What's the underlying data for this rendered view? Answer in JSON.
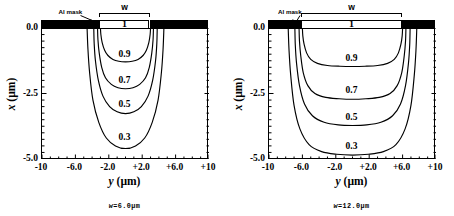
{
  "figure": {
    "panels": [
      {
        "id": "left",
        "caption": "w=6.0µm",
        "mask_label": "Al mask",
        "width_label": "w",
        "surface_label": "1",
        "opening_um": 6.0,
        "x_axis": {
          "title_var": "y",
          "title_unit": "(µm)",
          "ticks": [
            "-10",
            "-6.0",
            "-2.0",
            "+2.0",
            "+6.0",
            "+10"
          ],
          "values": [
            -10,
            -6,
            -2,
            2,
            6,
            10
          ],
          "range": [
            -10,
            10
          ]
        },
        "y_axis": {
          "title_var": "x",
          "title_unit": "(µm)",
          "ticks": [
            "0.0",
            "-2.5",
            "-5.0"
          ],
          "values": [
            0,
            -2.5,
            -5
          ],
          "range": [
            -5,
            0
          ]
        },
        "contour_labels": [
          "0.9",
          "0.7",
          "0.5",
          "0.3"
        ]
      },
      {
        "id": "right",
        "caption": "w=12.0µm",
        "mask_label": "Al mask",
        "width_label": "w",
        "surface_label": "1",
        "opening_um": 12.0,
        "x_axis": {
          "title_var": "y",
          "title_unit": "(µm)",
          "ticks": [
            "-10",
            "-6.0",
            "-2.0",
            "+2.0",
            "+6.0",
            "+10"
          ],
          "values": [
            -10,
            -6,
            -2,
            2,
            6,
            10
          ],
          "range": [
            -10,
            10
          ]
        },
        "y_axis": {
          "title_var": "x",
          "title_unit": "(µm)",
          "ticks": [
            "0.0",
            "-2.5",
            "-5.0"
          ],
          "values": [
            0,
            -2.5,
            -5
          ],
          "range": [
            -5,
            0
          ]
        },
        "contour_labels": [
          "0.9",
          "0.7",
          "0.5",
          "0.3"
        ]
      }
    ]
  },
  "chart_data": [
    {
      "type": "line",
      "title": "w=6.0µm",
      "xlabel": "y (µm)",
      "ylabel": "x (µm)",
      "xlim": [
        -10,
        10
      ],
      "ylim": [
        -5,
        0
      ],
      "grid": false,
      "legend": "inline-contour-labels",
      "annotations": [
        "Al mask",
        "w",
        "1"
      ],
      "mask_opening_um": 6.0,
      "mask_edges_um": [
        -3.0,
        3.0
      ],
      "series": [
        {
          "name": "0.9",
          "level": 0.9,
          "x": [
            -3.0,
            -2.95,
            -2.8,
            -2.5,
            -2.1,
            -1.5,
            -0.8,
            0.0,
            0.8,
            1.5,
            2.1,
            2.5,
            2.8,
            2.95,
            3.0
          ],
          "y": [
            0.0,
            -0.25,
            -0.55,
            -0.85,
            -1.05,
            -1.2,
            -1.27,
            -1.29,
            -1.27,
            -1.2,
            -1.05,
            -0.85,
            -0.55,
            -0.25,
            0.0
          ]
        },
        {
          "name": "0.7",
          "level": 0.7,
          "x": [
            -3.35,
            -3.3,
            -3.15,
            -2.85,
            -2.4,
            -1.7,
            -0.9,
            0.0,
            0.9,
            1.7,
            2.4,
            2.85,
            3.15,
            3.3,
            3.35
          ],
          "y": [
            0.0,
            -0.45,
            -0.95,
            -1.5,
            -1.9,
            -2.15,
            -2.28,
            -2.32,
            -2.28,
            -2.15,
            -1.9,
            -1.5,
            -0.95,
            -0.45,
            0.0
          ]
        },
        {
          "name": "0.5",
          "level": 0.5,
          "x": [
            -3.8,
            -3.75,
            -3.6,
            -3.25,
            -2.7,
            -1.9,
            -1.0,
            0.0,
            1.0,
            1.9,
            2.7,
            3.25,
            3.6,
            3.75,
            3.8
          ],
          "y": [
            0.0,
            -0.6,
            -1.25,
            -2.0,
            -2.6,
            -3.0,
            -3.2,
            -3.27,
            -3.2,
            -3.0,
            -2.6,
            -2.0,
            -1.25,
            -0.6,
            0.0
          ]
        },
        {
          "name": "0.3",
          "level": 0.3,
          "x": [
            -4.6,
            -4.5,
            -4.3,
            -3.9,
            -3.2,
            -2.3,
            -1.2,
            0.0,
            1.2,
            2.3,
            3.2,
            3.9,
            4.3,
            4.5,
            4.6
          ],
          "y": [
            0.0,
            -0.8,
            -1.7,
            -2.75,
            -3.6,
            -4.2,
            -4.5,
            -4.6,
            -4.5,
            -4.2,
            -3.6,
            -2.75,
            -1.7,
            -0.8,
            0.0
          ]
        }
      ]
    },
    {
      "type": "line",
      "title": "w=12.0µm",
      "xlabel": "y (µm)",
      "ylabel": "x (µm)",
      "xlim": [
        -10,
        10
      ],
      "ylim": [
        -5,
        0
      ],
      "grid": false,
      "legend": "inline-contour-labels",
      "annotations": [
        "Al mask",
        "w",
        "1"
      ],
      "mask_opening_um": 12.0,
      "mask_edges_um": [
        -6.0,
        6.0
      ],
      "series": [
        {
          "name": "0.9",
          "level": 0.9,
          "x": [
            -6.0,
            -5.95,
            -5.8,
            -5.5,
            -5.0,
            -4.2,
            -3.0,
            -1.5,
            0.0,
            1.5,
            3.0,
            4.2,
            5.0,
            5.5,
            5.8,
            5.95,
            6.0
          ],
          "y": [
            0.0,
            -0.3,
            -0.62,
            -0.95,
            -1.2,
            -1.35,
            -1.43,
            -1.46,
            -1.47,
            -1.46,
            -1.43,
            -1.35,
            -1.2,
            -0.95,
            -0.62,
            -0.3,
            0.0
          ]
        },
        {
          "name": "0.7",
          "level": 0.7,
          "x": [
            -6.4,
            -6.35,
            -6.2,
            -5.9,
            -5.35,
            -4.5,
            -3.2,
            -1.6,
            0.0,
            1.6,
            3.2,
            4.5,
            5.35,
            5.9,
            6.2,
            6.35,
            6.4
          ],
          "y": [
            0.0,
            -0.5,
            -1.05,
            -1.7,
            -2.2,
            -2.5,
            -2.65,
            -2.7,
            -2.72,
            -2.7,
            -2.65,
            -2.5,
            -2.2,
            -1.7,
            -1.05,
            -0.5,
            0.0
          ]
        },
        {
          "name": "0.5",
          "level": 0.5,
          "x": [
            -6.9,
            -6.85,
            -6.7,
            -6.35,
            -5.75,
            -4.8,
            -3.4,
            -1.7,
            0.0,
            1.7,
            3.4,
            4.8,
            5.75,
            6.35,
            6.7,
            6.85,
            6.9
          ],
          "y": [
            0.0,
            -0.65,
            -1.35,
            -2.2,
            -2.9,
            -3.35,
            -3.6,
            -3.7,
            -3.72,
            -3.7,
            -3.6,
            -3.35,
            -2.9,
            -2.2,
            -1.35,
            -0.65,
            0.0
          ]
        },
        {
          "name": "0.3",
          "level": 0.3,
          "x": [
            -7.7,
            -7.6,
            -7.4,
            -7.0,
            -6.3,
            -5.2,
            -3.7,
            -1.9,
            0.0,
            1.9,
            3.7,
            5.2,
            6.3,
            7.0,
            7.4,
            7.6,
            7.7
          ],
          "y": [
            0.0,
            -0.85,
            -1.8,
            -2.95,
            -3.85,
            -4.45,
            -4.72,
            -4.82,
            -4.85,
            -4.82,
            -4.72,
            -4.45,
            -3.85,
            -2.95,
            -1.8,
            -0.85,
            0.0
          ]
        }
      ]
    }
  ]
}
